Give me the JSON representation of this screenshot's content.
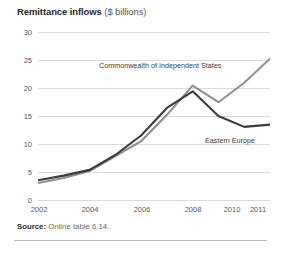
{
  "title": {
    "bold": "Remittance inflows",
    "normal": "($ billions)"
  },
  "source": {
    "label": "Source:",
    "text": "Online table 6.14."
  },
  "colors": {
    "cis_line": "#8d8f91",
    "eastern_europe_line": "#3a3b3d",
    "gridline": "#d8dadc",
    "tick_text": "#55585a",
    "rule": "#b9bcbe"
  },
  "chart_data": {
    "type": "line",
    "title": "Remittance inflows ($ billions)",
    "xlabel": "",
    "ylabel": "",
    "ylim": [
      0,
      30
    ],
    "yticks": [
      0,
      5,
      10,
      15,
      20,
      25,
      30
    ],
    "ytick_labels": [
      "0",
      "5",
      "10",
      "15",
      "20",
      "25",
      "30"
    ],
    "xlim": [
      2002,
      2011
    ],
    "x": [
      2002,
      2003,
      2004,
      2005,
      2006,
      2007,
      2008,
      2009,
      2010,
      2011
    ],
    "xticks": [
      2002,
      2004,
      2006,
      2008,
      2010,
      2011
    ],
    "xtick_labels": [
      "2002",
      "2004",
      "2006",
      "2008",
      "2010",
      "2011"
    ],
    "grid": "horizontal",
    "legend": "inline-annotations",
    "series": [
      {
        "name": "Commonwealth of Independent States",
        "color": "#8d8f91",
        "values": [
          3.3,
          4.2,
          5.4,
          8.0,
          10.6,
          15.2,
          20.3,
          17.4,
          20.8,
          25.0
        ]
      },
      {
        "name": "Eastern Europe",
        "color": "#3a3b3d",
        "values": [
          3.8,
          4.6,
          5.6,
          8.2,
          11.6,
          16.4,
          19.3,
          15.0,
          13.1,
          13.5
        ]
      }
    ],
    "annotations": [
      {
        "text": "Commonwealth of Independent States",
        "series": "Commonwealth of Independent States"
      },
      {
        "text": "Eastern Europe",
        "series": "Eastern Europe"
      }
    ]
  }
}
